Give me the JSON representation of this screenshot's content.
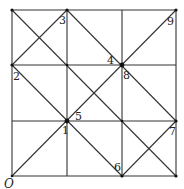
{
  "figure": {
    "type": "grid-diagram",
    "grid": {
      "cols": 3,
      "rows": 3,
      "origin_label": "O"
    },
    "line_color": "#333333",
    "labels": [
      {
        "id": "1",
        "text": "1"
      },
      {
        "id": "2",
        "text": "2"
      },
      {
        "id": "3",
        "text": "3"
      },
      {
        "id": "4",
        "text": "4"
      },
      {
        "id": "5",
        "text": "5"
      },
      {
        "id": "6",
        "text": "6"
      },
      {
        "id": "7",
        "text": "7"
      },
      {
        "id": "8",
        "text": "8"
      },
      {
        "id": "9",
        "text": "9"
      },
      {
        "id": "O",
        "text": "O"
      }
    ],
    "points": {
      "1": [
        1,
        1
      ],
      "2": [
        0,
        2
      ],
      "3": [
        1,
        3
      ],
      "4": [
        2,
        2
      ],
      "5": [
        1,
        1
      ],
      "6": [
        2,
        0
      ],
      "7": [
        3,
        1
      ],
      "8": [
        2,
        2
      ],
      "9": [
        3,
        3
      ],
      "O": [
        0,
        0
      ]
    },
    "diagonals": [
      [
        [
          0,
          0
        ],
        [
          3,
          3
        ]
      ],
      [
        [
          0,
          3
        ],
        [
          3,
          0
        ]
      ],
      [
        [
          0,
          2
        ],
        [
          1,
          3
        ]
      ],
      [
        [
          1,
          3
        ],
        [
          3,
          1
        ]
      ],
      [
        [
          0,
          2
        ],
        [
          2,
          0
        ]
      ],
      [
        [
          2,
          0
        ],
        [
          3,
          1
        ]
      ]
    ]
  }
}
